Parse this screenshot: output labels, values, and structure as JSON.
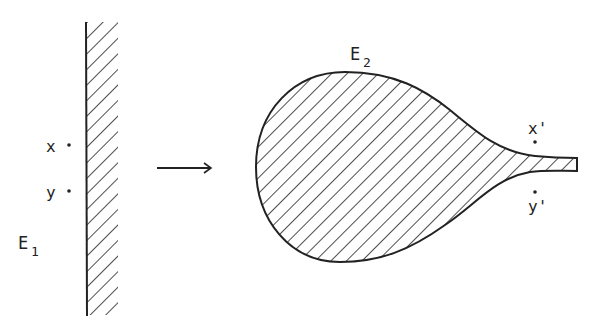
{
  "figure": {
    "colors": {
      "ink": "#222222",
      "background": "#ffffff"
    },
    "left_region": {
      "label": "E",
      "subscript": "1",
      "points": [
        {
          "label": "x"
        },
        {
          "label": "y"
        }
      ]
    },
    "arrow": {
      "direction": "right",
      "icon": "arrow-right"
    },
    "right_region": {
      "label": "E",
      "subscript": "2",
      "points": [
        {
          "label": "x'"
        },
        {
          "label": "y'"
        }
      ]
    }
  }
}
